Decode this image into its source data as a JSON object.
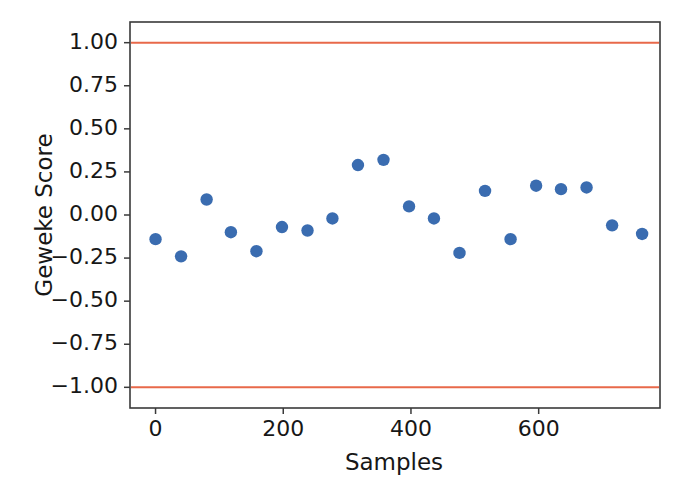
{
  "chart_data": {
    "type": "scatter",
    "title": "",
    "xlabel": "Samples",
    "ylabel": "Geweke Score",
    "xlim": [
      -40,
      790
    ],
    "ylim": [
      -1.12,
      1.12
    ],
    "grid": false,
    "legend": null,
    "x_ticks": [
      0,
      200,
      400,
      600
    ],
    "x_tick_labels": [
      "0",
      "200",
      "400",
      "600"
    ],
    "y_ticks": [
      1.0,
      0.75,
      0.5,
      0.25,
      0.0,
      -0.25,
      -0.5,
      -0.75,
      -1.0
    ],
    "y_tick_labels": [
      "1.00",
      "0.75",
      "0.50",
      "0.25",
      "0.00",
      "−0.25",
      "−0.50",
      "−0.75",
      "−1.00"
    ],
    "series": [
      {
        "name": "Geweke scores",
        "marker": "circle",
        "color": "#3a6cb0",
        "x": [
          0,
          40,
          80,
          118,
          158,
          198,
          238,
          277,
          317,
          357,
          397,
          436,
          476,
          516,
          556,
          596,
          635,
          675,
          715,
          762
        ],
        "y": [
          -0.14,
          -0.24,
          0.09,
          -0.1,
          -0.21,
          -0.07,
          -0.09,
          -0.02,
          0.29,
          0.32,
          0.05,
          -0.02,
          -0.22,
          0.14,
          -0.14,
          0.17,
          0.15,
          0.16,
          -0.06,
          -0.11
        ]
      }
    ],
    "threshold_lines": [
      {
        "name": "upper-threshold",
        "value": 1.0,
        "color": "#e8694a"
      },
      {
        "name": "lower-threshold",
        "value": -1.0,
        "color": "#e8694a"
      }
    ],
    "colors": {
      "point": "#3a6cb0",
      "threshold": "#e8694a",
      "axis": "#3a3a3a",
      "text": "#171717",
      "background": "#ffffff"
    }
  }
}
